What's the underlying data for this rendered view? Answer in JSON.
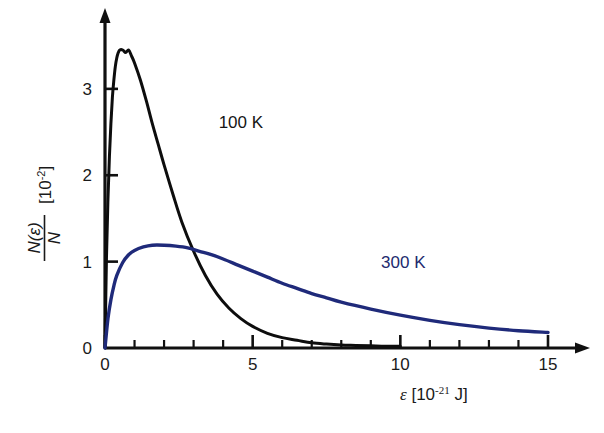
{
  "chart_data": {
    "type": "line",
    "title": "",
    "xlabel": "ε [10⁻²¹ J]",
    "ylabel": "N(ε)/N [10⁻²]",
    "xlabel_parts": {
      "symbol": "ε",
      "bracket_open": " [10",
      "exponent": "-21",
      "unit": " J]"
    },
    "ylabel_parts": {
      "numerator": "N(ε)",
      "denominator": "N",
      "bracket_open": "[10",
      "exponent": "-2",
      "bracket_close": "]"
    },
    "xlim": [
      0,
      15.6
    ],
    "ylim": [
      0,
      3.75
    ],
    "xticks": [
      0,
      5,
      10,
      15
    ],
    "xtick_labels": [
      "0",
      "5",
      "10",
      "15"
    ],
    "yticks": [
      0,
      1,
      2,
      3
    ],
    "ytick_labels": [
      "0",
      "1",
      "2",
      "3"
    ],
    "xminor_step": 1,
    "grid": false,
    "legend_position": "inline-annotation",
    "axis_style": "arrow-terminated",
    "series": [
      {
        "name": "100 K",
        "color": "#0d0d0d",
        "label_x": 4.6,
        "label_y": 2.55,
        "peak_x": 0.8,
        "peak_y": 3.45,
        "x": [
          0.0,
          0.05,
          0.1,
          0.15,
          0.2,
          0.25,
          0.3,
          0.35,
          0.4,
          0.45,
          0.5,
          0.6,
          0.7,
          0.8,
          0.9,
          1.0,
          1.2,
          1.4,
          1.6,
          1.8,
          2.0,
          2.3,
          2.6,
          3.0,
          3.4,
          3.8,
          4.2,
          4.6,
          5.0,
          5.5,
          6.0,
          6.5,
          7.0,
          7.5,
          8.0,
          8.5,
          9.0,
          9.5,
          10.0
        ],
        "y": [
          0.0,
          1.05,
          1.72,
          2.22,
          2.6,
          2.9,
          3.1,
          3.26,
          3.36,
          3.42,
          3.45,
          3.45,
          3.42,
          3.45,
          3.38,
          3.3,
          3.1,
          2.86,
          2.6,
          2.36,
          2.12,
          1.78,
          1.46,
          1.12,
          0.84,
          0.62,
          0.46,
          0.34,
          0.25,
          0.17,
          0.12,
          0.09,
          0.06,
          0.045,
          0.035,
          0.03,
          0.025,
          0.02,
          0.02
        ]
      },
      {
        "name": "300 K",
        "color": "#1f2a7a",
        "label_x": 10.1,
        "label_y": 0.93,
        "peak_x": 2.1,
        "peak_y": 1.19,
        "x": [
          0.0,
          0.1,
          0.2,
          0.3,
          0.4,
          0.6,
          0.8,
          1.0,
          1.3,
          1.6,
          2.0,
          2.4,
          2.8,
          3.2,
          3.6,
          4.0,
          4.5,
          5.0,
          5.5,
          6.0,
          6.5,
          7.0,
          7.5,
          8.0,
          9.0,
          10.0,
          11.0,
          12.0,
          13.0,
          14.0,
          15.0
        ],
        "y": [
          0.0,
          0.34,
          0.56,
          0.72,
          0.84,
          0.99,
          1.08,
          1.13,
          1.17,
          1.19,
          1.19,
          1.18,
          1.16,
          1.12,
          1.08,
          1.03,
          0.96,
          0.89,
          0.82,
          0.75,
          0.69,
          0.63,
          0.58,
          0.53,
          0.45,
          0.38,
          0.32,
          0.27,
          0.23,
          0.2,
          0.18
        ]
      }
    ]
  },
  "annotations": [
    {
      "name": "label-100k",
      "text": "100 K"
    },
    {
      "name": "label-300k",
      "text": "300 K"
    }
  ]
}
